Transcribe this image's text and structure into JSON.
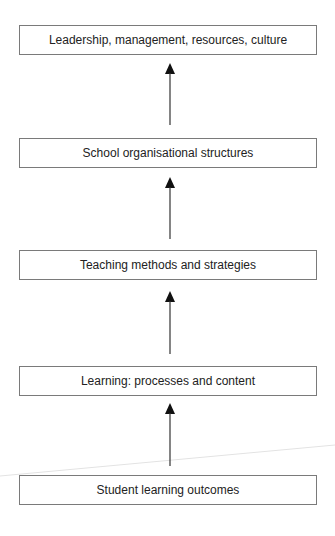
{
  "diagram": {
    "type": "vertical flow (bottom to top)",
    "boxes": [
      {
        "label": "Leadership, management, resources, culture"
      },
      {
        "label": "School organisational structures"
      },
      {
        "label": "Teaching methods and strategies"
      },
      {
        "label": "Learning: processes and content"
      },
      {
        "label": "Student learning outcomes"
      }
    ],
    "arrows": [
      {
        "from": "Student learning outcomes",
        "to": "Learning: processes and content"
      },
      {
        "from": "Learning: processes and content",
        "to": "Teaching methods and strategies"
      },
      {
        "from": "Teaching methods and strategies",
        "to": "School organisational structures"
      },
      {
        "from": "School organisational structures",
        "to": "Leadership, management, resources, culture"
      }
    ],
    "colors": {
      "border": "#7a7a7a",
      "arrow": "#111111",
      "text": "#222222"
    }
  }
}
